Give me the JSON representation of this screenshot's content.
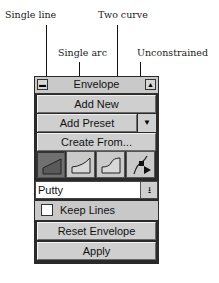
{
  "callouts": {
    "single_line": "Single line",
    "single_arc": "Single arc",
    "two_curve": "Two curve",
    "unconstrained": "Unconstrained"
  },
  "panel": {
    "title": "Envelope",
    "close_icon": "minus-bar-icon",
    "collapse_icon": "triangle-up-icon",
    "buttons": {
      "add_new": "Add New",
      "add_preset": "Add Preset",
      "create_from": "Create From...",
      "reset_envelope": "Reset Envelope",
      "apply": "Apply"
    },
    "preset_menu_icon": "triangle-down-icon",
    "modes": [
      {
        "name": "Single line",
        "selected": true
      },
      {
        "name": "Single arc",
        "selected": false
      },
      {
        "name": "Two curve",
        "selected": false
      },
      {
        "name": "Unconstrained",
        "selected": false
      }
    ],
    "mapping_dropdown": {
      "value": "Putty",
      "arrow_icon": "dropdown-arrow-icon"
    },
    "keep_lines": {
      "label": "Keep Lines",
      "checked": false
    }
  }
}
